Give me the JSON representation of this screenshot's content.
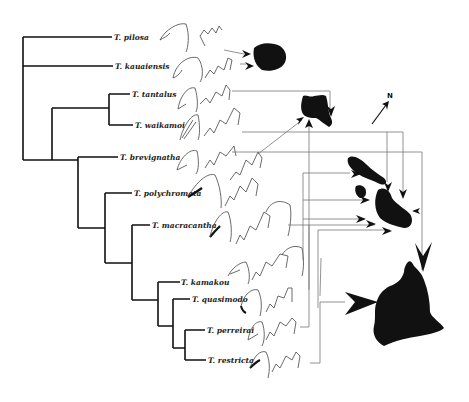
{
  "figure": {
    "compass_label": "N",
    "taxa": [
      {
        "name": "T. pilosa"
      },
      {
        "name": "T. kauaiensis"
      },
      {
        "name": "T. tantalus"
      },
      {
        "name": "T. waikamoi"
      },
      {
        "name": "T. brevignatha"
      },
      {
        "name": "T. polychromata"
      },
      {
        "name": "T. macracantha"
      },
      {
        "name": "T. kamakou"
      },
      {
        "name": "T. quasimodo"
      },
      {
        "name": "T. perreirai"
      },
      {
        "name": "T. restricta"
      }
    ],
    "islands": [
      "Kauai",
      "Oahu",
      "Maui Nui",
      "Hawaii"
    ],
    "colors": {
      "ink": "#111111",
      "connector": "#777777",
      "background": "#ffffff"
    }
  }
}
